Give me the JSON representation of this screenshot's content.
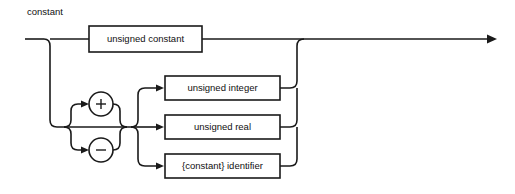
{
  "diagram": {
    "title": "constant",
    "type": "railroad-syntax-diagram",
    "colors": {
      "background": "#ffffff",
      "stroke": "#1a1a1a",
      "text": "#101010",
      "box_fill": "#ffffff"
    },
    "entry": {
      "name": "entry-rail",
      "label": ""
    },
    "exit": {
      "name": "exit-rail",
      "label": ""
    },
    "branches": {
      "top": {
        "box_label": "unsigned constant"
      },
      "signs": [
        {
          "symbol": "+",
          "name": "plus"
        },
        {
          "symbol": "−",
          "name": "minus"
        }
      ],
      "terms": [
        {
          "box_label": "unsigned integer"
        },
        {
          "box_label": "unsigned real"
        },
        {
          "box_label": "{constant} identifier"
        }
      ]
    }
  }
}
